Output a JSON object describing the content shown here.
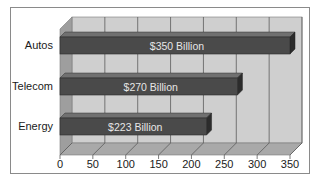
{
  "chart_data": {
    "type": "bar",
    "orientation": "horizontal",
    "style": "3d",
    "title": "",
    "xlabel": "",
    "ylabel": "",
    "categories": [
      "Autos",
      "Telecom",
      "Energy"
    ],
    "values": [
      350,
      270,
      223
    ],
    "data_labels": [
      "$350 Billion",
      "$270 Billion",
      "$223 Billion"
    ],
    "units": "Billion USD",
    "xlim": [
      0,
      350
    ],
    "x_ticks": [
      0,
      50,
      100,
      150,
      200,
      250,
      300,
      350
    ],
    "x_tick_labels": [
      "0",
      "50",
      "100",
      "150",
      "200",
      "250",
      "300",
      "350"
    ],
    "grid": true,
    "legend": null
  },
  "colors": {
    "frame_border": "#8a8a8a",
    "back_wall": "#cfcfcf",
    "side_wall": "#9e9e9e",
    "floor": "#a9a9a9",
    "gridline": "#5c5c5c",
    "bar_front": "#4a4a4a",
    "bar_top": "#707070",
    "bar_end": "#2c2c2c",
    "bar_label": "#e6e6e6",
    "text": "#1a1a1a"
  }
}
